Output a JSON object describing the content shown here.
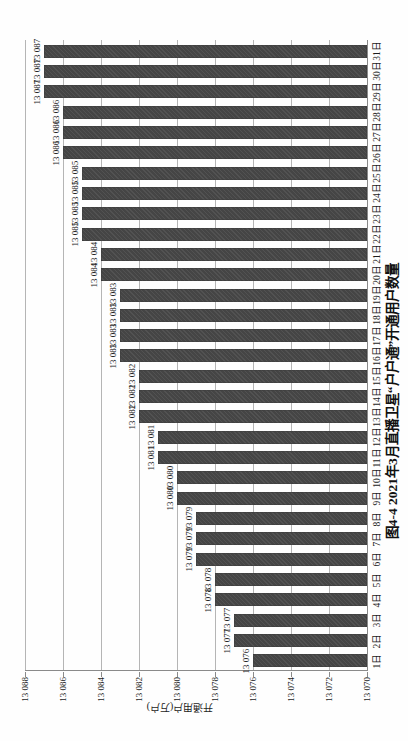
{
  "figure": {
    "caption": "图4-4  2021年3月直播卫星“户户通”开通用户数量"
  },
  "chart_data": {
    "type": "bar",
    "title": "图4-4  2021年3月直播卫星“户户通”开通用户数量",
    "xlabel": "",
    "ylabel": "开通用户(万户)",
    "categories": [
      "1日",
      "2日",
      "3日",
      "4日",
      "5日",
      "6日",
      "7日",
      "8日",
      "9日",
      "10日",
      "11日",
      "12日",
      "13日",
      "14日",
      "15日",
      "16日",
      "17日",
      "18日",
      "19日",
      "20日",
      "21日",
      "22日",
      "23日",
      "24日",
      "25日",
      "26日",
      "27日",
      "28日",
      "29日",
      "30日",
      "31日"
    ],
    "values": [
      13076,
      13077,
      13077,
      13078,
      13078,
      13079,
      13079,
      13079,
      13080,
      13080,
      13081,
      13081,
      13082,
      13082,
      13082,
      13083,
      13083,
      13083,
      13083,
      13084,
      13084,
      13085,
      13085,
      13085,
      13085,
      13086,
      13086,
      13086,
      13087,
      13087,
      13087
    ],
    "value_labels": [
      "13 076",
      "13 077",
      "13 077",
      "13 078",
      "13 078",
      "13 079",
      "13 079",
      "13 079",
      "13 080",
      "13 080",
      "13 081",
      "13 081",
      "13 082",
      "13 082",
      "13 082",
      "13 083",
      "13 083",
      "13 083",
      "13 083",
      "13 084",
      "13 084",
      "13 085",
      "13 085",
      "13 085",
      "13 085",
      "13 086",
      "13 086",
      "13 086",
      "13 087",
      "13 087",
      "13 087"
    ],
    "ylim": [
      13070,
      13088
    ],
    "ytick_step": 2,
    "yticks_display": [
      "13 088",
      "13 086",
      "13 084",
      "13 082",
      "13 080",
      "13 078",
      "13 076",
      "13 074",
      "13 072",
      "13 070"
    ],
    "grid": true,
    "legend": "none",
    "bar_color": "#454545",
    "gridline_color": "#b5b5b5",
    "axis_color": "#8a8a8a",
    "text_color": "#1c1c1c",
    "page_rotation": "chart rotated 90deg counterclockwise on portrait page"
  }
}
